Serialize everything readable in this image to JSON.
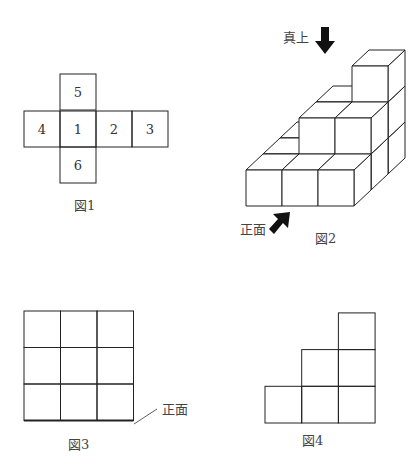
{
  "figures": {
    "fig1": {
      "caption": "図1",
      "net_faces": [
        {
          "label": "5",
          "col": 1,
          "row": 0
        },
        {
          "label": "4",
          "col": 0,
          "row": 1
        },
        {
          "label": "1",
          "col": 1,
          "row": 1
        },
        {
          "label": "2",
          "col": 2,
          "row": 1
        },
        {
          "label": "3",
          "col": 3,
          "row": 1
        },
        {
          "label": "6",
          "col": 1,
          "row": 2
        }
      ]
    },
    "fig2": {
      "caption": "図2",
      "top_label": "真上",
      "front_label": "正面",
      "column_heights_front_to_back": [
        [
          1,
          1,
          1
        ],
        [
          1,
          2,
          2
        ],
        [
          1,
          2,
          3
        ]
      ]
    },
    "fig3": {
      "caption": "図3",
      "front_label": "正面",
      "grid": {
        "rows": 3,
        "cols": 3
      }
    },
    "fig4": {
      "caption": "図4",
      "column_heights": [
        1,
        2,
        3
      ]
    }
  },
  "colors": {
    "line": "#222222",
    "arrow": "#111111"
  }
}
